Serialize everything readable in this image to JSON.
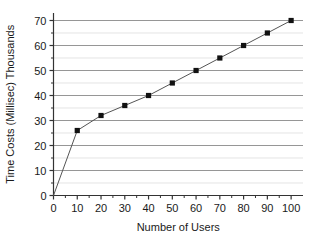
{
  "chart_data": {
    "type": "line",
    "title": "",
    "subtitle": "",
    "xlabel": "Number of Users",
    "ylabel": "Time Costs (Millisec) Thousands",
    "x": [
      0,
      10,
      20,
      30,
      40,
      50,
      60,
      70,
      80,
      90,
      100
    ],
    "values": [
      0,
      26,
      32,
      36,
      40,
      45,
      50,
      55,
      60,
      65,
      70
    ],
    "series": [
      {
        "name": "Time Costs",
        "x": [
          0,
          10,
          20,
          30,
          40,
          50,
          60,
          70,
          80,
          90,
          100
        ],
        "values": [
          0,
          26,
          32,
          36,
          40,
          45,
          50,
          55,
          60,
          65,
          70
        ],
        "marker": "square",
        "marker_color": "#111111",
        "line_color": "#555555"
      }
    ],
    "xlim": [
      0,
      105
    ],
    "ylim": [
      0,
      73
    ],
    "xticks": [
      0,
      10,
      20,
      30,
      40,
      50,
      60,
      70,
      80,
      90,
      100
    ],
    "yticks": [
      0,
      10,
      20,
      30,
      40,
      50,
      60,
      70
    ],
    "xtick_labels": [
      "0",
      "10",
      "20",
      "30",
      "40",
      "50",
      "60",
      "70",
      "80",
      "90",
      "100"
    ],
    "ytick_labels": [
      "0",
      "10",
      "20",
      "30",
      "40",
      "50",
      "60",
      "70"
    ],
    "minor_tick_step_x": 5,
    "minor_tick_step_y": 5,
    "grid": {
      "horizontal_major": true,
      "horizontal_minor": true,
      "vertical": false,
      "major_color": "#8a8a8a",
      "minor_color": "#d8d8d8"
    },
    "legend": {
      "visible": false,
      "position": "none",
      "entries": []
    },
    "annotations": [],
    "axis_color": "#333333",
    "background_color": "#ffffff",
    "spines": {
      "left": true,
      "bottom": true,
      "top": false,
      "right": false
    }
  }
}
